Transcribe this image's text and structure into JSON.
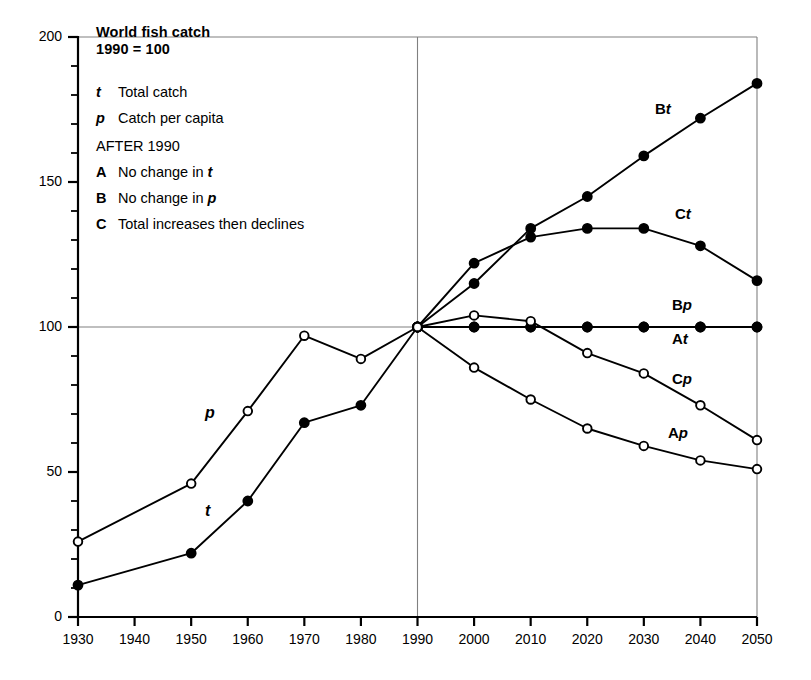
{
  "figure": {
    "title": "World fish catch",
    "subtitle": "1990 = 100"
  },
  "legend": {
    "entries": [
      {
        "key": "t",
        "key_style": "italic",
        "text": "Total catch"
      },
      {
        "key": "p",
        "key_style": "italic",
        "text": "Catch per capita"
      }
    ],
    "section_heading": "AFTER 1990",
    "scenarios": [
      {
        "key": "A",
        "text_before": "No change in ",
        "text_em": "t",
        "text_after": ""
      },
      {
        "key": "B",
        "text_before": "No change in ",
        "text_em": "p",
        "text_after": ""
      },
      {
        "key": "C",
        "text_before": "Total increases then declines",
        "text_em": "",
        "text_after": ""
      }
    ]
  },
  "axes": {
    "y_ticks_major": [
      0,
      50,
      100,
      150,
      200
    ],
    "y_tick_labels": [
      "0",
      "50",
      "100",
      "150",
      "200"
    ],
    "y_minor_step": 10,
    "x_ticks": [
      1930,
      1940,
      1950,
      1960,
      1970,
      1980,
      1990,
      2000,
      2010,
      2020,
      2030,
      2040,
      2050
    ],
    "x_tick_labels": [
      "1930",
      "1940",
      "1950",
      "1960",
      "1970",
      "1980",
      "1990",
      "2000",
      "2010",
      "2020",
      "2030",
      "2040",
      "2050"
    ],
    "gridlines": {
      "vertical_at": 1990,
      "horizontal_at": 100
    }
  },
  "curve_labels": [
    {
      "id": "Bt",
      "letter": "B",
      "sym": "t"
    },
    {
      "id": "Ct",
      "letter": "C",
      "sym": "t"
    },
    {
      "id": "Bp",
      "letter": "B",
      "sym": "p"
    },
    {
      "id": "At",
      "letter": "A",
      "sym": "t"
    },
    {
      "id": "Cp",
      "letter": "C",
      "sym": "p"
    },
    {
      "id": "Ap",
      "letter": "A",
      "sym": "p"
    }
  ],
  "inline_labels": [
    {
      "id": "p-historic",
      "text": "p"
    },
    {
      "id": "t-historic",
      "text": "t"
    }
  ],
  "colors": {
    "ink": "#000000",
    "paper": "#ffffff",
    "grid": "#808080"
  },
  "chart_data": {
    "type": "line",
    "title": "World fish catch",
    "subtitle": "1990 = 100",
    "xlabel": "",
    "ylabel": "",
    "xlim": [
      1930,
      2050
    ],
    "ylim": [
      0,
      200
    ],
    "grid": "single crosshair gridlines at x=1990 and y=100",
    "legend_position": "inline curve labels at right; key block top-left",
    "series": [
      {
        "name": "t",
        "label": "Total catch (historic)",
        "marker": "filled-circle",
        "x": [
          1930,
          1950,
          1960,
          1970,
          1980,
          1990
        ],
        "values": [
          11,
          22,
          40,
          67,
          73,
          100
        ]
      },
      {
        "name": "p",
        "label": "Catch per capita (historic)",
        "marker": "open-circle",
        "x": [
          1930,
          1950,
          1960,
          1970,
          1980,
          1990
        ],
        "values": [
          26,
          46,
          71,
          97,
          89,
          100
        ]
      },
      {
        "name": "Bt",
        "label": "B: total catch, no change in p",
        "marker": "filled-circle",
        "x": [
          1990,
          2000,
          2010,
          2020,
          2030,
          2040,
          2050
        ],
        "values": [
          100,
          115,
          134,
          145,
          159,
          172,
          184
        ]
      },
      {
        "name": "Ct",
        "label": "C: total increases then declines",
        "marker": "filled-circle",
        "x": [
          1990,
          2000,
          2010,
          2020,
          2030,
          2040,
          2050
        ],
        "values": [
          100,
          122,
          131,
          134,
          134,
          128,
          116
        ]
      },
      {
        "name": "At",
        "label": "A: total catch, no change in t",
        "marker": "filled-circle",
        "x": [
          1990,
          2000,
          2010,
          2020,
          2030,
          2040,
          2050
        ],
        "values": [
          100,
          100,
          100,
          100,
          100,
          100,
          100
        ]
      },
      {
        "name": "Bp",
        "label": "B: catch per capita, no change in p",
        "marker": "filled-circle",
        "x": [
          1990,
          2000,
          2010,
          2020,
          2030,
          2040,
          2050
        ],
        "values": [
          100,
          100,
          100,
          100,
          100,
          100,
          100
        ]
      },
      {
        "name": "Cp",
        "label": "C: catch per capita",
        "marker": "open-circle",
        "x": [
          1990,
          2000,
          2010,
          2020,
          2030,
          2040,
          2050
        ],
        "values": [
          100,
          104,
          102,
          91,
          84,
          73,
          61
        ]
      },
      {
        "name": "Ap",
        "label": "A: catch per capita",
        "marker": "open-circle",
        "x": [
          1990,
          2000,
          2010,
          2020,
          2030,
          2040,
          2050
        ],
        "values": [
          100,
          86,
          75,
          65,
          59,
          54,
          51
        ]
      }
    ]
  }
}
